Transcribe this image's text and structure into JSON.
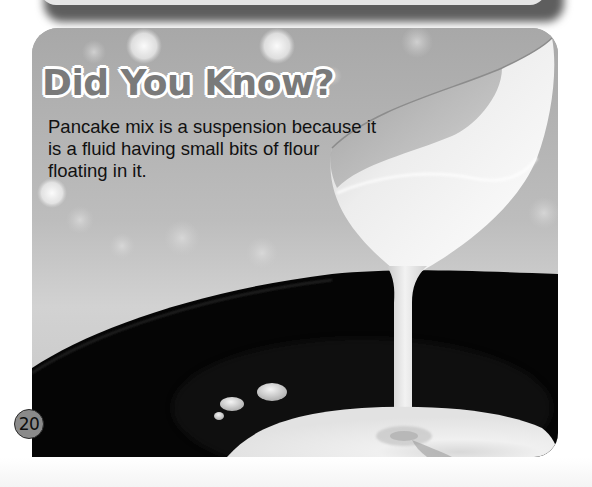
{
  "callout": {
    "title": "Did You Know?",
    "body": "Pancake mix is a suspension because it is a fluid having small bits of flour floating in it."
  },
  "page": {
    "number": "20"
  },
  "photo": {
    "subject": "pancake batter pouring from a ladle into a black frying pan",
    "elements": [
      "bokeh-background",
      "white-ladle",
      "batter-stream",
      "frying-pan",
      "batter-pool",
      "batter-droplets"
    ]
  },
  "colors": {
    "title_fill": "#7a7a7a",
    "title_outline": "#ffffff",
    "body_text": "#111111",
    "pan": "#050505",
    "batter": "#e8e8e8",
    "badge_fill": "#8a8a8a"
  }
}
